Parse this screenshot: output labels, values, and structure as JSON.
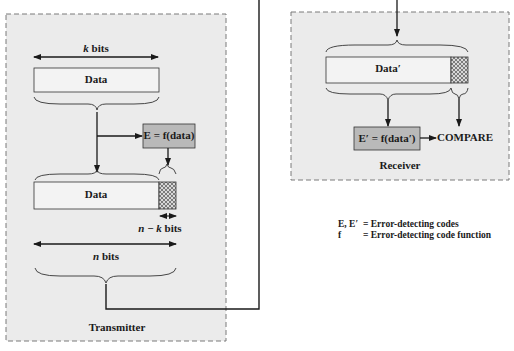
{
  "transmitter": {
    "title": "Transmitter",
    "k_label_var": "k",
    "k_label_unit": " bits",
    "data_label": "Data",
    "function_box": "E = f(data)",
    "codeword_data_label": "Data",
    "nk_label_n": "n",
    "nk_label_minus": " − ",
    "nk_label_k": "k",
    "nk_label_unit": " bits",
    "n_label_var": "n",
    "n_label_unit": " bits"
  },
  "receiver": {
    "title": "Receiver",
    "data_label": "Data′",
    "function_box": "E′ = f(data′)",
    "compare_label": "COMPARE"
  },
  "legend": {
    "items": [
      {
        "symbol": "E, E′",
        "definition": "= Error-detecting codes"
      },
      {
        "symbol": "f",
        "definition": "= Error-detecting code function"
      }
    ]
  },
  "colors": {
    "panel_fill": "#ebebeb",
    "panel_border": "#7a7a7a",
    "function_box_fill": "#b9b9b9",
    "line": "#1a1a1a",
    "box_fill": "#f3f3f3"
  }
}
